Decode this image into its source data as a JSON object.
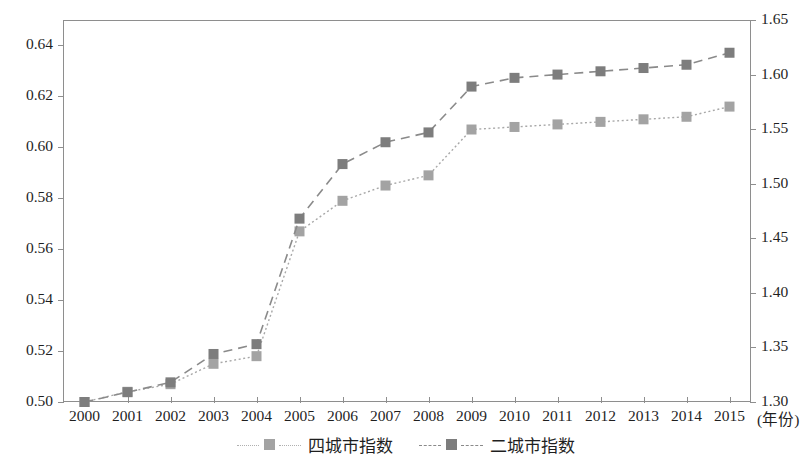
{
  "chart_data": {
    "type": "line",
    "title": "",
    "xlabel": "(年份)",
    "ylabel": "",
    "y2label": "",
    "grid": false,
    "legend_position": "bottom-center",
    "categories": [
      "2000",
      "2001",
      "2002",
      "2003",
      "2004",
      "2005",
      "2006",
      "2007",
      "2008",
      "2009",
      "2010",
      "2011",
      "2012",
      "2013",
      "2014",
      "2015"
    ],
    "x_tick_labels": [
      "2000",
      "2001",
      "2002",
      "2003",
      "2004",
      "2005",
      "2006",
      "2007",
      "2008",
      "2009",
      "2010",
      "2011",
      "2012",
      "2013",
      "2014",
      "2015"
    ],
    "x_unit_label": "(年份)",
    "ylim": [
      0.5,
      0.65
    ],
    "y_ticks": [
      "0.50",
      "0.52",
      "0.54",
      "0.56",
      "0.58",
      "0.60",
      "0.62",
      "0.64"
    ],
    "y_tick_values": [
      0.5,
      0.52,
      0.54,
      0.56,
      0.58,
      0.6,
      0.62,
      0.64
    ],
    "y2lim": [
      1.3,
      1.65
    ],
    "y2_ticks": [
      "1.30",
      "1.35",
      "1.40",
      "1.45",
      "1.50",
      "1.55",
      "1.60",
      "1.65"
    ],
    "y2_tick_values": [
      1.3,
      1.35,
      1.4,
      1.45,
      1.5,
      1.55,
      1.6,
      1.65
    ],
    "series": [
      {
        "name": "四城市指数",
        "axis": "left",
        "line_style": "dotted",
        "marker": "square",
        "color": "#a8a8a8",
        "marker_color": "#a3a3a3",
        "values": [
          0.5,
          0.504,
          0.507,
          0.515,
          0.518,
          0.567,
          0.579,
          0.585,
          0.589,
          0.607,
          0.608,
          0.609,
          0.61,
          0.611,
          0.612,
          0.616
        ]
      },
      {
        "name": "二城市指数",
        "axis": "right",
        "line_style": "dashed",
        "marker": "square",
        "color": "#8a8a8a",
        "marker_color": "#7d7d7d",
        "values": [
          1.3,
          1.309,
          1.318,
          1.344,
          1.353,
          1.468,
          1.518,
          1.538,
          1.547,
          1.589,
          1.597,
          1.6,
          1.603,
          1.606,
          1.609,
          1.62
        ]
      }
    ]
  },
  "legend": {
    "items": [
      {
        "label": "四城市指数",
        "style": "dotted",
        "color": "#a3a3a3"
      },
      {
        "label": "二城市指数",
        "style": "dashed",
        "color": "#7d7d7d"
      }
    ]
  },
  "colors": {
    "axis": "#8e8e8e",
    "text": "#1f1f1f",
    "series_one": "#a3a3a3",
    "series_two": "#7d7d7d",
    "background": "#ffffff"
  }
}
